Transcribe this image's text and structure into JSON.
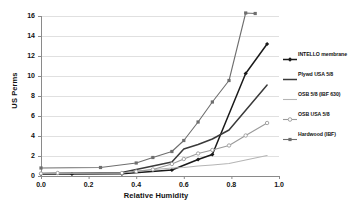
{
  "chart_data": {
    "type": "line",
    "title": "",
    "xlabel": "Relative Humidity",
    "ylabel": "US Perms",
    "xlim": [
      0,
      1.0
    ],
    "ylim": [
      0,
      16
    ],
    "xticks": [
      "0.0",
      "0.2",
      "0.4",
      "0.6",
      "0.8",
      "1.0"
    ],
    "xtick_values": [
      0.0,
      0.2,
      0.4,
      0.6,
      0.8,
      1.0
    ],
    "yticks": [
      "0",
      "2",
      "4",
      "6",
      "8",
      "10",
      "12",
      "14",
      "16"
    ],
    "ytick_values": [
      0,
      2,
      4,
      6,
      8,
      10,
      12,
      14,
      16
    ],
    "grid": "horizontal",
    "legend_position": "right",
    "series": [
      {
        "name": "INTELLO membrane",
        "color": "#1a1a1a",
        "marker": "diamond",
        "x": [
          0.0,
          0.13,
          0.34,
          0.55,
          0.66,
          0.72,
          0.86,
          0.95
        ],
        "y": [
          0.2,
          0.2,
          0.22,
          0.6,
          1.65,
          2.15,
          10.25,
          13.2
        ]
      },
      {
        "name": "Plywd USA 5/8",
        "color": "#3a3a3a",
        "marker": "none",
        "x": [
          0.0,
          0.34,
          0.55,
          0.6,
          0.66,
          0.72,
          0.79,
          0.95
        ],
        "y": [
          0.25,
          0.35,
          1.4,
          2.7,
          3.15,
          3.7,
          4.6,
          9.1
        ]
      },
      {
        "name": "OSB 5/8 (IBF 630)",
        "color": "#b5b5b5",
        "marker": "none",
        "x": [
          0.0,
          0.34,
          0.4,
          0.55,
          0.6,
          0.66,
          0.72,
          0.79,
          0.86,
          0.95
        ],
        "y": [
          0.25,
          0.3,
          0.5,
          0.8,
          0.85,
          1.0,
          1.1,
          1.25,
          1.6,
          2.05
        ]
      },
      {
        "name": "OSB USA 5/8",
        "color": "#9a9a9a",
        "marker": "circle",
        "x": [
          0.0,
          0.07,
          0.34,
          0.4,
          0.47,
          0.55,
          0.6,
          0.66,
          0.72,
          0.79,
          0.86,
          0.95
        ],
        "y": [
          0.25,
          0.3,
          0.3,
          0.45,
          0.65,
          1.2,
          1.7,
          2.25,
          2.6,
          3.05,
          4.05,
          5.3
        ]
      },
      {
        "name": "Hardwood (IBF)",
        "color": "#6e6e6e",
        "marker": "square",
        "x": [
          0.0,
          0.25,
          0.4,
          0.47,
          0.55,
          0.6,
          0.66,
          0.72,
          0.79,
          0.86,
          0.9
        ],
        "y": [
          0.8,
          0.85,
          1.3,
          1.85,
          2.45,
          3.55,
          5.4,
          7.4,
          9.55,
          16.3,
          16.25
        ]
      }
    ]
  },
  "axes": {
    "x_title": "Relative Humidity",
    "y_title": "US Perms"
  },
  "legend": {
    "entries": [
      {
        "label": "INTELLO membrane"
      },
      {
        "label": "Plywd USA 5/8"
      },
      {
        "label": "OSB 5/8 (IBF 630)"
      },
      {
        "label": "OSB USA 5/8"
      },
      {
        "label": "Hardwood (IBF)"
      }
    ]
  },
  "colors": {
    "intello": "#1a1a1a",
    "plywd": "#3a3a3a",
    "osb_ibf": "#b5b5b5",
    "osb_usa": "#9a9a9a",
    "hardwood": "#6e6e6e",
    "grid": "#d8d8d8",
    "axis": "#8a8a8a",
    "background": "#ffffff"
  }
}
